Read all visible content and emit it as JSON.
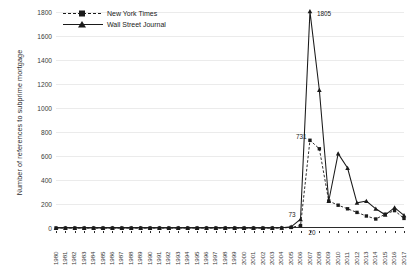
{
  "chart_data": {
    "type": "line",
    "title": "",
    "xlabel": "",
    "ylabel": "Number of references to subprime mortgage",
    "ylim": [
      0,
      1800
    ],
    "ytick_step": 200,
    "yticks": [
      0,
      200,
      400,
      600,
      800,
      1000,
      1200,
      1400,
      1600,
      1800
    ],
    "grid": true,
    "legend_position": "top-left",
    "categories": [
      "1980",
      "1981",
      "1982",
      "1983",
      "1984",
      "1985",
      "1986",
      "1987",
      "1988",
      "1989",
      "1990",
      "1991",
      "1992",
      "1993",
      "1994",
      "1995",
      "1996",
      "1997",
      "1998",
      "1999",
      "2000",
      "2001",
      "2002",
      "2003",
      "2004",
      "2005",
      "2006",
      "2007",
      "2008",
      "2009",
      "2010",
      "2011",
      "2012",
      "2013",
      "2014",
      "2015",
      "2016",
      "2017"
    ],
    "series": [
      {
        "name": "New York Times",
        "style": "dashed",
        "marker": "square",
        "color": "#1a1a1a",
        "values": [
          0,
          0,
          0,
          0,
          0,
          0,
          0,
          0,
          0,
          0,
          0,
          0,
          0,
          0,
          0,
          0,
          0,
          0,
          0,
          0,
          0,
          0,
          0,
          0,
          0,
          5,
          20,
          731,
          660,
          225,
          190,
          160,
          130,
          100,
          75,
          115,
          145,
          80
        ]
      },
      {
        "name": "Wall Street Journal",
        "style": "solid",
        "marker": "triangle",
        "color": "#1a1a1a",
        "values": [
          0,
          0,
          0,
          0,
          0,
          0,
          0,
          0,
          0,
          0,
          0,
          0,
          0,
          0,
          0,
          0,
          0,
          0,
          0,
          0,
          0,
          0,
          0,
          0,
          2,
          10,
          73,
          1805,
          1150,
          225,
          620,
          500,
          210,
          225,
          160,
          110,
          170,
          105
        ]
      }
    ],
    "annotations": [
      {
        "label": "1805",
        "series": "Wall Street Journal",
        "category": "2007",
        "value": 1805
      },
      {
        "label": "731",
        "series": "New York Times",
        "category": "2007",
        "value": 731
      },
      {
        "label": "73",
        "series": "Wall Street Journal",
        "category": "2006",
        "value": 73
      },
      {
        "label": "20",
        "series": "New York Times",
        "category": "2006",
        "value": 20
      }
    ]
  },
  "legend": {
    "items": [
      {
        "label": "New York Times"
      },
      {
        "label": "Wall Street Journal"
      }
    ]
  }
}
